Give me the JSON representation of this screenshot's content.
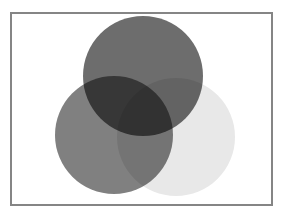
{
  "diagram": {
    "type": "venn",
    "frame": {
      "x": 10,
      "y": 12,
      "width": 259,
      "height": 190,
      "border_color": "#858585"
    },
    "circles": [
      {
        "id": "left",
        "cx": 114,
        "cy": 135,
        "r": 59,
        "fill": "#808080"
      },
      {
        "id": "right",
        "cx": 176,
        "cy": 137,
        "r": 59,
        "fill": "#e8e8e8"
      },
      {
        "id": "top",
        "cx": 143,
        "cy": 76,
        "r": 60,
        "fill": "#6d6d6d"
      }
    ]
  }
}
